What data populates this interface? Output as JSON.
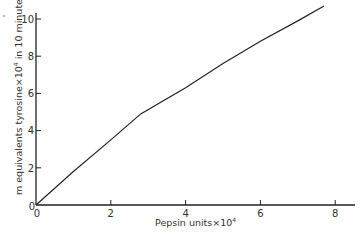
{
  "chart_data": {
    "type": "line",
    "title": "",
    "xlabel": "Pepsin units×10⁴",
    "ylabel": "m equivalents tyrosine×10⁴ in 10 minutes",
    "xlim": [
      0,
      8.5
    ],
    "ylim": [
      0,
      10.5
    ],
    "x_ticks": [
      0,
      2,
      4,
      6,
      8
    ],
    "y_ticks": [
      0,
      2,
      4,
      6,
      8,
      10
    ],
    "grid": false,
    "legend": null,
    "series": [
      {
        "name": "tyrosine liberated",
        "x": [
          0,
          1,
          2,
          2.8,
          4,
          5,
          6,
          7,
          7.7
        ],
        "y": [
          0,
          1.8,
          3.5,
          4.9,
          6.3,
          7.6,
          8.8,
          9.9,
          10.7
        ]
      }
    ]
  },
  "labels": {
    "x_axis": "Pepsin units×10",
    "x_axis_exp": "4",
    "y_axis_a": "m equivalents tyrosine×10",
    "y_axis_exp": "4",
    "y_axis_b": " in 10 minutes",
    "origin_x": "0",
    "origin_y": "0",
    "x_tick_2": "2",
    "x_tick_4": "4",
    "x_tick_6": "6",
    "x_tick_8": "8",
    "y_tick_2": "2",
    "y_tick_4": "4",
    "y_tick_6": "6",
    "y_tick_8": "8",
    "y_tick_10": "10"
  }
}
